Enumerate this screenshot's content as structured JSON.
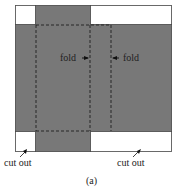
{
  "diagram": {
    "colors": {
      "fill": "#787878",
      "outline": "#444444",
      "background": "#ffffff",
      "dash": "#1e1e1e",
      "text": "#222222"
    },
    "labels": {
      "fold_left": "fold",
      "fold_right": "fold",
      "cutout_left": "cut out",
      "cutout_right": "cut out",
      "caption": "(a)"
    }
  }
}
